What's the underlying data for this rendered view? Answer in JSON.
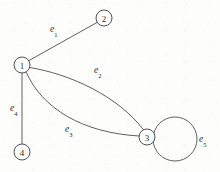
{
  "figure": {
    "background_color": "#fdfdfc",
    "stroke_color": "#4e4e4e",
    "text_color": "#2b2b2b",
    "width": 220,
    "height": 172
  },
  "vertices": [
    {
      "id": "1",
      "label": "1",
      "cx": 22,
      "cy": 65,
      "r": 8
    },
    {
      "id": "2",
      "label": "2",
      "cx": 104,
      "cy": 18,
      "r": 8
    },
    {
      "id": "3",
      "label": "3",
      "cx": 147,
      "cy": 137,
      "r": 8
    },
    {
      "id": "4",
      "label": "4",
      "cx": 22,
      "cy": 152,
      "r": 8
    }
  ],
  "edges": [
    {
      "id": "e1",
      "label": "e",
      "subscript": "1",
      "from": "1",
      "to": "2",
      "shape": "straight",
      "label_x": 50,
      "label_y": 25
    },
    {
      "id": "e2",
      "label": "e",
      "subscript": "2",
      "from": "1",
      "to": "3",
      "shape": "curve-upper",
      "label_x": 94,
      "label_y": 66
    },
    {
      "id": "e3",
      "label": "e",
      "subscript": "3",
      "from": "1",
      "to": "3",
      "shape": "curve-lower",
      "label_x": 65,
      "label_y": 125
    },
    {
      "id": "e4",
      "label": "e",
      "subscript": "4",
      "from": "1",
      "to": "4",
      "shape": "straight",
      "label_x": 10,
      "label_y": 104
    },
    {
      "id": "e5",
      "label": "e",
      "subscript": "5",
      "from": "3",
      "to": "3",
      "shape": "loop",
      "loop_cx": 175,
      "loop_cy": 139,
      "loop_r": 22,
      "label_x": 199,
      "label_y": 135
    }
  ]
}
